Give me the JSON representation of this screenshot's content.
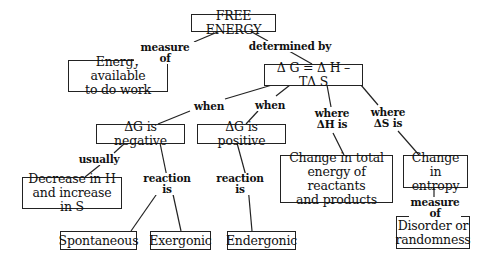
{
  "nodes": {
    "free_energy": "FREE ENERGY",
    "energy_available": "Energy available\nto do work",
    "equation": "Δ G = Δ H – TΔ S",
    "dg_negative": "ΔG is negative",
    "dg_positive": "ΔG is positive",
    "change_total_energy": "Change in total\nenergy of reactants\nand products",
    "change_entropy": "Change in\nentropy",
    "decrease_h": "Decrease in H\nand increase in S",
    "disorder": "Disorder or\nrandomness",
    "spontaneous": "Spontaneous",
    "exergonic": "Exergonic",
    "endergonic": "Endergonic"
  },
  "links": {
    "measure_of_1": "measure of",
    "determined_by": "determined by",
    "when_1": "when",
    "when_2": "when",
    "where_dh": "where\nΔH is",
    "where_ds": "where\nΔS is",
    "usually": "usually",
    "reaction_is_1": "reaction is",
    "reaction_is_2": "reaction is",
    "measure_of_2": "measure of"
  }
}
